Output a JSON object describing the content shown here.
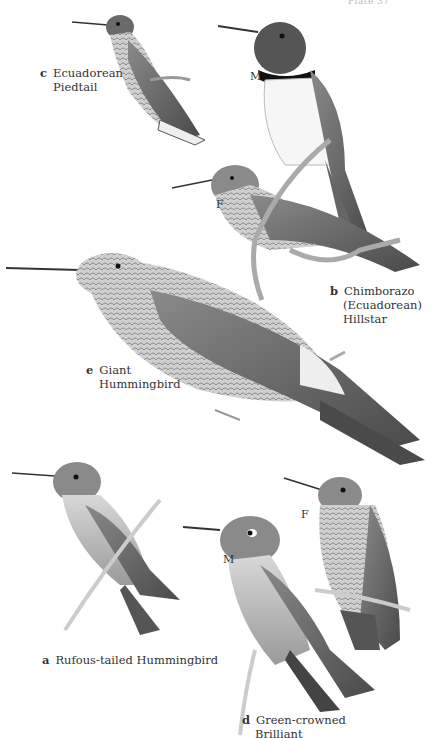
{
  "plate": {
    "header": "Plate 37",
    "colors": {
      "background": "#ffffff",
      "ink": "#333333",
      "bird_dark": "#3a3a3a",
      "bird_mid": "#7a7a7a",
      "bird_light": "#c8c8c8"
    }
  },
  "species": [
    {
      "letter": "a",
      "name_lines": [
        "Rufous-tailed Hummingbird"
      ]
    },
    {
      "letter": "b",
      "name_lines": [
        "Chimborazo",
        "(Ecuadorean)",
        "Hillstar"
      ],
      "sexes": [
        "M",
        "F"
      ]
    },
    {
      "letter": "c",
      "name_lines": [
        "Ecuadorean",
        "Piedtail"
      ]
    },
    {
      "letter": "d",
      "name_lines": [
        "Green-crowned",
        "Brilliant"
      ],
      "sexes": [
        "M",
        "F"
      ]
    },
    {
      "letter": "e",
      "name_lines": [
        "Giant",
        "Hummingbird"
      ]
    }
  ]
}
